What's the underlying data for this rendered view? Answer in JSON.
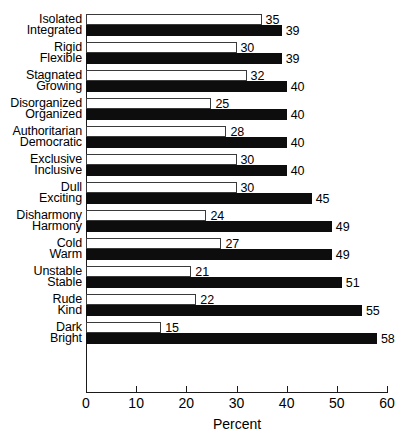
{
  "chart_data": {
    "type": "bar",
    "orientation": "horizontal",
    "title": "",
    "xlabel": "Percent",
    "ylabel": "",
    "xlim": [
      0,
      60
    ],
    "xticks": [
      0,
      10,
      20,
      30,
      40,
      50,
      60
    ],
    "grid": false,
    "legend": null,
    "colors": {
      "open_bar": "#ffffff",
      "open_bar_border": "#3a3a3a",
      "filled_bar": "#0d0d0d",
      "axis": "#1a1a1a",
      "text": "#000000"
    },
    "pairs": [
      {
        "negative": {
          "label": "Isolated",
          "value": 35,
          "style": "open"
        },
        "positive": {
          "label": "Integrated",
          "value": 39,
          "style": "filled"
        }
      },
      {
        "negative": {
          "label": "Rigid",
          "value": 30,
          "style": "open"
        },
        "positive": {
          "label": "Flexible",
          "value": 39,
          "style": "filled"
        }
      },
      {
        "negative": {
          "label": "Stagnated",
          "value": 32,
          "style": "open"
        },
        "positive": {
          "label": "Growing",
          "value": 40,
          "style": "filled"
        }
      },
      {
        "negative": {
          "label": "Disorganized",
          "value": 25,
          "style": "open"
        },
        "positive": {
          "label": "Organized",
          "value": 40,
          "style": "filled"
        }
      },
      {
        "negative": {
          "label": "Authoritarian",
          "value": 28,
          "style": "open"
        },
        "positive": {
          "label": "Democratic",
          "value": 40,
          "style": "filled"
        }
      },
      {
        "negative": {
          "label": "Exclusive",
          "value": 30,
          "style": "open"
        },
        "positive": {
          "label": "Inclusive",
          "value": 40,
          "style": "filled"
        }
      },
      {
        "negative": {
          "label": "Dull",
          "value": 30,
          "style": "open"
        },
        "positive": {
          "label": "Exciting",
          "value": 45,
          "style": "filled"
        }
      },
      {
        "negative": {
          "label": "Disharmony",
          "value": 24,
          "style": "open"
        },
        "positive": {
          "label": "Harmony",
          "value": 49,
          "style": "filled"
        }
      },
      {
        "negative": {
          "label": "Cold",
          "value": 27,
          "style": "open"
        },
        "positive": {
          "label": "Warm",
          "value": 49,
          "style": "filled"
        }
      },
      {
        "negative": {
          "label": "Unstable",
          "value": 21,
          "style": "open"
        },
        "positive": {
          "label": "Stable",
          "value": 51,
          "style": "filled"
        }
      },
      {
        "negative": {
          "label": "Rude",
          "value": 22,
          "style": "open"
        },
        "positive": {
          "label": "Kind",
          "value": 55,
          "style": "filled"
        }
      },
      {
        "negative": {
          "label": "Dark",
          "value": 15,
          "style": "open"
        },
        "positive": {
          "label": "Bright",
          "value": 58,
          "style": "filled"
        }
      }
    ],
    "categories": [
      "Isolated",
      "Integrated",
      "Rigid",
      "Flexible",
      "Stagnated",
      "Growing",
      "Disorganized",
      "Organized",
      "Authoritarian",
      "Democratic",
      "Exclusive",
      "Inclusive",
      "Dull",
      "Exciting",
      "Disharmony",
      "Harmony",
      "Cold",
      "Warm",
      "Unstable",
      "Stable",
      "Rude",
      "Kind",
      "Dark",
      "Bright"
    ],
    "values": [
      35,
      39,
      30,
      39,
      32,
      40,
      25,
      40,
      28,
      40,
      30,
      40,
      30,
      45,
      24,
      49,
      27,
      49,
      21,
      51,
      22,
      55,
      15,
      58
    ]
  }
}
